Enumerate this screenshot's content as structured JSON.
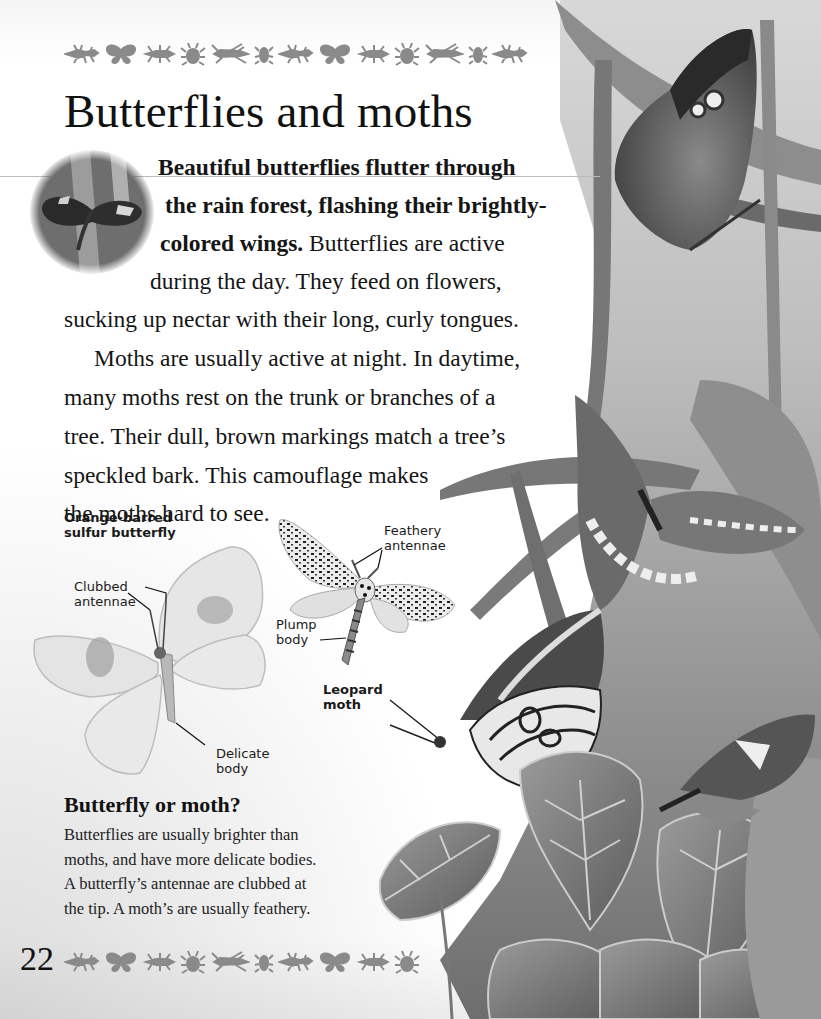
{
  "page": {
    "title": "Butterflies and moths",
    "page_number": "22",
    "border_icons": [
      "wasp-icon",
      "butterfly-icon",
      "beetle-icon",
      "bug-icon",
      "grasshopper-icon",
      "small-beetle-icon",
      "wasp-icon",
      "butterfly-icon",
      "beetle-icon",
      "bug-icon",
      "grasshopper-icon",
      "small-beetle-icon",
      "wasp-icon"
    ],
    "border_color": "#8a8a8a"
  },
  "intro": {
    "lines": [
      {
        "bold": "Beautiful butterflies flutter through",
        "normal": ""
      },
      {
        "bold": "the rain forest, flashing their brightly-",
        "normal": ""
      },
      {
        "bold": "colored wings.",
        "normal": " Butterflies are active"
      },
      {
        "bold": "",
        "normal": "during the day. They feed on flowers,"
      },
      {
        "bold": "",
        "normal": "sucking up nectar with their long, curly tongues."
      }
    ]
  },
  "body": {
    "lines": [
      "Moths are usually active at night. In daytime,",
      "many moths rest on the trunk or branches of a",
      "tree. Their dull, brown markings match a tree’s",
      "speckled bark. This camouflage makes",
      "the moths hard to see."
    ]
  },
  "labels": {
    "butterfly_name_1": "Orange-barred",
    "butterfly_name_2": "sulfur butterfly",
    "clubbed_1": "Clubbed",
    "clubbed_2": "antennae",
    "delicate_1": "Delicate",
    "delicate_2": "body",
    "feathery_1": "Feathery",
    "feathery_2": "antennae",
    "plump_1": "Plump",
    "plump_2": "body",
    "moth_name_1": "Leopard",
    "moth_name_2": "moth"
  },
  "sidebar": {
    "heading": "Butterfly or moth?",
    "lines": [
      "Butterflies are usually brighter than",
      "moths, and have more delicate bodies.",
      "A butterfly’s antennae are clubbed at",
      "the tip. A moth’s are usually feathery."
    ]
  }
}
